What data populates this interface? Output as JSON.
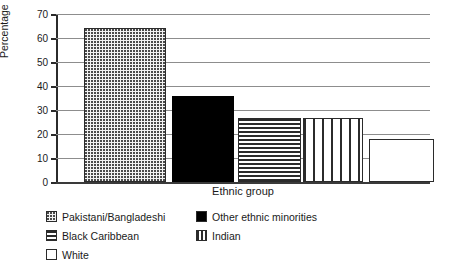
{
  "chart_data": {
    "type": "bar",
    "title": "",
    "xlabel": "Ethnic group",
    "ylabel": "Percentage",
    "ylim": [
      0,
      70
    ],
    "ytick_step": 10,
    "yticks": [
      "70",
      "60",
      "50",
      "40",
      "30",
      "20",
      "10",
      "0"
    ],
    "grid": true,
    "legend_position": "bottom-left",
    "categories": [
      "Pakistani/Bangladeshi",
      "Other ethnic minorities",
      "Black Caribbean",
      "Indian",
      "White"
    ],
    "values": [
      64,
      36,
      26.5,
      26.5,
      18
    ],
    "bars": [
      {
        "label": "Pakistani/Bangladeshi",
        "value": 64,
        "pattern": "dots"
      },
      {
        "label": "Other ethnic minorities",
        "value": 36,
        "pattern": "solid-black"
      },
      {
        "label": "Black Caribbean",
        "value": 26.5,
        "pattern": "horizontal-lines"
      },
      {
        "label": "Indian",
        "value": 26.5,
        "pattern": "vertical-lines"
      },
      {
        "label": "White",
        "value": 18,
        "pattern": "white"
      }
    ]
  },
  "legend": {
    "entries": [
      {
        "label": "Pakistani/Bangladeshi",
        "pattern": "dots"
      },
      {
        "label": "Other ethnic minorities",
        "pattern": "solid-black"
      },
      {
        "label": "Black Caribbean",
        "pattern": "horizontal-lines"
      },
      {
        "label": "Indian",
        "pattern": "vertical-lines"
      },
      {
        "label": "White",
        "pattern": "white"
      }
    ]
  },
  "colors": {
    "axis": "#2b2b2b",
    "gridline": "#8d8d8d",
    "bar_outline": "#2b2b2b",
    "solid_fill": "#000000",
    "background": "#ffffff"
  }
}
